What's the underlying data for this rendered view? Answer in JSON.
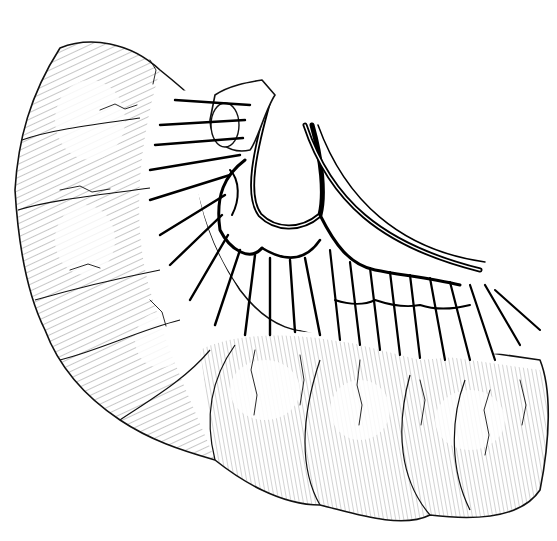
{
  "figure": {
    "style": "black ink line drawing with hatching on white",
    "colors": {
      "background": "#ffffff",
      "ink": "#000000"
    },
    "labels": []
  }
}
